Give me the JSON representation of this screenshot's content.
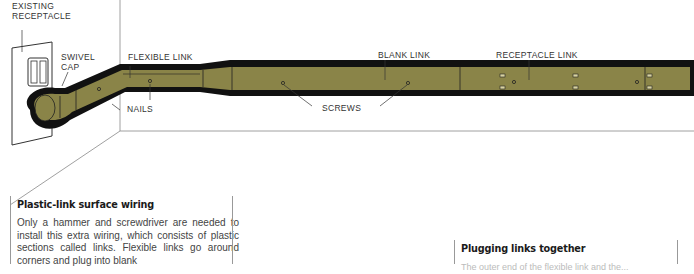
{
  "labels": {
    "existing_receptacle_line1": "EXISTING",
    "existing_receptacle_line2": "RECEPTACLE",
    "swivel_cap_line1": "SWIVEL",
    "swivel_cap_line2": "CAP",
    "flexible_link": "FLEXIBLE LINK",
    "nails": "NAILS",
    "blank_link": "BLANK LINK",
    "screws": "SCREWS",
    "receptacle_link": "RECEPTACLE LINK"
  },
  "colors": {
    "link_fill": "#8a8448",
    "link_outline": "#111111",
    "wall_line": "#777777"
  },
  "caption_left": {
    "heading": "Plastic-link surface wiring",
    "body": "Only a hammer and screwdriver are needed to install this extra wiring, which consists of plastic sections called links. Flexible links go around corners and plug into blank"
  },
  "caption_right": {
    "heading": "Plugging links together",
    "body": "The outer end of the flexible link and the..."
  }
}
